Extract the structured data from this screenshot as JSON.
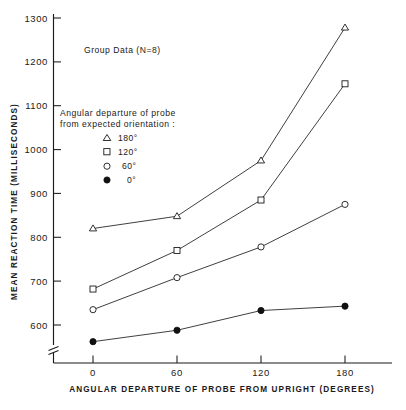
{
  "chart_data": {
    "type": "line",
    "title": "",
    "annotation": "Group Data (N=8)",
    "xlabel": "ANGULAR DEPARTURE OF PROBE FROM UPRIGHT (DEGREES)",
    "ylabel": "MEAN REACTION TIME (MILLISECONDS)",
    "x": [
      0,
      60,
      120,
      180
    ],
    "xtick_labels": [
      "0",
      "60",
      "120",
      "180"
    ],
    "ytick_labels": [
      "600",
      "700",
      "800",
      "900",
      "1000",
      "1100",
      "1200",
      "1300"
    ],
    "ytick_values": [
      600,
      700,
      800,
      900,
      1000,
      1100,
      1200,
      1300
    ],
    "xlim": [
      0,
      180
    ],
    "ylim": [
      600,
      1300
    ],
    "grid": false,
    "axis_break": true,
    "legend_position": "upper-left-inside",
    "legend_title_line1": "Angular departure of probe",
    "legend_title_line2": "from expected orientation :",
    "series": [
      {
        "name": "180°",
        "marker": "open-triangle",
        "values": [
          820,
          848,
          975,
          1278
        ]
      },
      {
        "name": "120°",
        "marker": "open-square",
        "values": [
          682,
          770,
          885,
          1150
        ]
      },
      {
        "name": "60°",
        "marker": "open-circle",
        "values": [
          635,
          708,
          778,
          875
        ]
      },
      {
        "name": "0°",
        "marker": "filled-circle",
        "values": [
          562,
          588,
          633,
          643
        ]
      }
    ],
    "colors": {
      "axis": "#1a1a1a",
      "line": "#2a2a2a",
      "marker_fill_open": "#ffffff",
      "marker_fill_closed": "#111111",
      "background": "#ffffff"
    }
  }
}
